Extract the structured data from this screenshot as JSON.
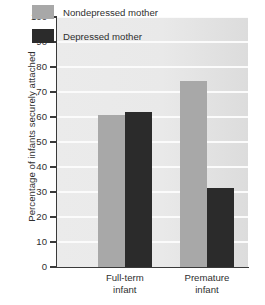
{
  "chart_data": {
    "type": "bar",
    "title": "",
    "xlabel": "",
    "ylabel": "Percentage of infants securely attached",
    "ylim": [
      0,
      100
    ],
    "ytick_step": 10,
    "grid": true,
    "legend_position": "top-center",
    "categories": [
      "Full-term infant",
      "Premature infant"
    ],
    "category_lines": [
      [
        "Full-term",
        "infant"
      ],
      [
        "Premature",
        "infant"
      ]
    ],
    "ytick_labels": [
      "100",
      "90",
      "80",
      "70",
      "60",
      "50",
      "40",
      "30",
      "20",
      "10",
      "0"
    ],
    "ytick_values": [
      100,
      90,
      80,
      70,
      60,
      50,
      40,
      30,
      20,
      10,
      0
    ],
    "series": [
      {
        "name": "Nondepressed mother",
        "color": "#a8a8a8",
        "values": [
          61,
          74.5
        ]
      },
      {
        "name": "Depressed mother",
        "color": "#2b2b2b",
        "values": [
          62,
          31.5
        ]
      }
    ]
  },
  "legend": {
    "items": [
      {
        "label": "Nondepressed mother",
        "swatch": "nondepressed"
      },
      {
        "label": "Depressed mother",
        "swatch": "depressed"
      }
    ]
  },
  "colors": {
    "nondepressed_bar": "#a8a8a8",
    "depressed_bar": "#2b2b2b",
    "plot_background": "#e9e9e9",
    "gridline": "#fbfbfb",
    "axis": "#3a3a3a",
    "text": "#2f2f2f"
  }
}
